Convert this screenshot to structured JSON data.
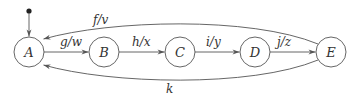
{
  "diagram": {
    "type": "state-machine",
    "initial_state": "A",
    "nodes": [
      {
        "id": "A",
        "label": "A",
        "cx": 29,
        "cy": 52
      },
      {
        "id": "B",
        "label": "B",
        "cx": 104,
        "cy": 52
      },
      {
        "id": "C",
        "label": "C",
        "cx": 180,
        "cy": 52
      },
      {
        "id": "D",
        "label": "D",
        "cx": 255,
        "cy": 52
      },
      {
        "id": "E",
        "label": "E",
        "cx": 331,
        "cy": 52
      }
    ],
    "edges": [
      {
        "from": "A",
        "to": "B",
        "label": "g/w"
      },
      {
        "from": "B",
        "to": "C",
        "label": "h/x"
      },
      {
        "from": "C",
        "to": "D",
        "label": "i/y"
      },
      {
        "from": "D",
        "to": "E",
        "label": "j/z"
      },
      {
        "from": "E",
        "to": "A",
        "label": "f/v",
        "route": "upper-arc"
      },
      {
        "from": "E",
        "to": "A",
        "label": "k",
        "route": "lower-arc"
      }
    ],
    "colors": {
      "stroke": "#555555",
      "text": "#333333",
      "background": "#ffffff"
    }
  }
}
